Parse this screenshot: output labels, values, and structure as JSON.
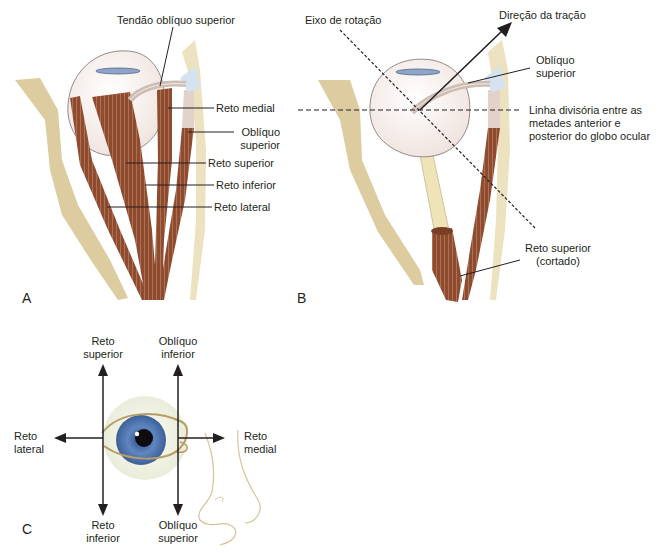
{
  "figure": {
    "panels": [
      {
        "letter": "A"
      },
      {
        "letter": "B"
      },
      {
        "letter": "C"
      }
    ],
    "panel_a": {
      "labels": {
        "superior_oblique_tendon": "Tendão oblíquo superior",
        "medial_rectus": "Reto medial",
        "superior_oblique_l1": "Oblíquo",
        "superior_oblique_l2": "superior",
        "superior_rectus": "Reto superior",
        "inferior_rectus": "Reto inferior",
        "lateral_rectus": "Reto lateral"
      }
    },
    "panel_b": {
      "labels": {
        "rotation_axis": "Eixo de rotação",
        "pull_direction": "Direção da tração",
        "superior_oblique_l1": "Oblíquo",
        "superior_oblique_l2": "superior",
        "dividing_line_l1": "Linha divisória entre as",
        "dividing_line_l2": "metades anterior e",
        "dividing_line_l3": "posterior do globo ocular",
        "superior_rectus_cut_l1": "Reto superior",
        "superior_rectus_cut_l2": "(cortado)"
      }
    },
    "panel_c": {
      "labels": {
        "up_left_l1": "Reto",
        "up_left_l2": "superior",
        "up_right_l1": "Oblíquo",
        "up_right_l2": "inferior",
        "left_l1": "Reto",
        "left_l2": "lateral",
        "right_l1": "Reto",
        "right_l2": "medial",
        "down_left_l1": "Reto",
        "down_left_l2": "inferior",
        "down_right_l1": "Oblíquo",
        "down_right_l2": "superior"
      }
    },
    "colors": {
      "muscle": "#8b4a2e",
      "bone": "#dccca0",
      "globe": "#f6efed",
      "iris": "#5b7fb5",
      "nerve": "#efe4b8",
      "line": "#231f20"
    }
  }
}
